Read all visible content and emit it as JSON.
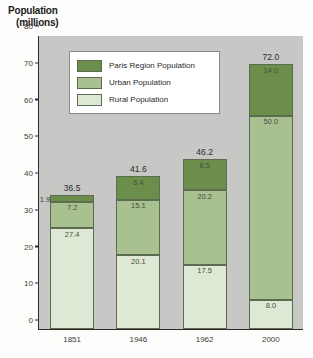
{
  "chart_data": {
    "type": "bar",
    "subtype": "stacked-bar",
    "title": "",
    "ylabel_line1": "Population",
    "ylabel_line2": "(millions)",
    "xlabel": "",
    "categories": [
      "1851",
      "1946",
      "1962",
      "2000"
    ],
    "totals": [
      "36.5",
      "41.6",
      "46.2",
      "72.0"
    ],
    "totals_numeric": [
      36.5,
      41.6,
      46.2,
      72.0
    ],
    "ylim": [
      0,
      80
    ],
    "yticks": [
      "80",
      "70",
      "60",
      "50",
      "40",
      "30",
      "20",
      "10",
      "0"
    ],
    "yticks_numeric": [
      80,
      70,
      60,
      50,
      40,
      30,
      20,
      10,
      0
    ],
    "grid": false,
    "legend_position": "upper-left-inside",
    "stack_order_bottom_to_top": [
      "Rural Population",
      "Urban Population",
      "Paris Region Population"
    ],
    "series": [
      {
        "name": "Paris Region Population",
        "color": "#6b8f4b",
        "values": [
          1.9,
          6.4,
          8.5,
          14.0
        ],
        "labels": [
          "1.9",
          "6.4",
          "8.5",
          "14.0"
        ]
      },
      {
        "name": "Urban Population",
        "color": "#a9c091",
        "values": [
          7.2,
          15.1,
          20.2,
          50.0
        ],
        "labels": [
          "7.2",
          "15.1",
          "20.2",
          "50.0"
        ]
      },
      {
        "name": "Rural Population",
        "color": "#dde9d4",
        "values": [
          27.4,
          20.1,
          17.5,
          8.0
        ],
        "labels": [
          "27.4",
          "20.1",
          "17.5",
          "8.0"
        ]
      }
    ],
    "plot_background": "#c7c8c5",
    "axis_color": "#2b2b2b"
  },
  "legend": {
    "items": [
      {
        "label": "Paris Region Population",
        "color": "#6b8f4b"
      },
      {
        "label": "Urban Population",
        "color": "#a9c091"
      },
      {
        "label": "Rural Population",
        "color": "#dde9d4"
      }
    ]
  }
}
